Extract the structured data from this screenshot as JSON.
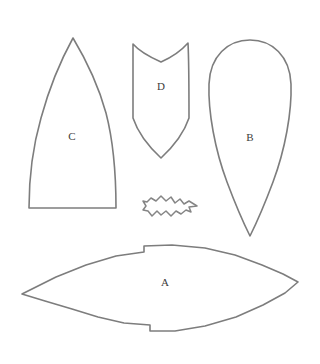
{
  "sheet": {
    "title": "Pattern piece layout",
    "background_color": "#ffffff",
    "outline_color": "#7d7d7d",
    "label_color": "#3c3c3c",
    "width": 320,
    "height": 364
  },
  "pieces": [
    {
      "id": "A",
      "label": "A",
      "name": "lens-body-piece",
      "description": "Large lens/eye shaped piece with notches top and bottom",
      "label_x": 165,
      "label_y": 283,
      "path": "M 22 294 L 56 277 L 86 265 L 116 256 L 144 252 L 144 246 L 172 245 L 205 248 L 235 255 L 262 265 L 283 274 L 298 282 L 285 293 L 263 305 L 236 317 L 205 326 L 175 331 L 150 331 L 150 325 L 124 323 L 98 317 L 72 309 L 45 301 Z"
    },
    {
      "id": "B",
      "label": "B",
      "name": "teardrop-piece",
      "description": "Teardrop shaped piece, rounded top, pointed bottom",
      "label_x": 250,
      "label_y": 138,
      "path": "M 250 40 C 272 40 290 56 291 84 C 292 112 285 150 273 182 C 264 206 255 226 250 236 C 245 226 236 206 227 182 C 215 150 208 112 209 84 C 210 56 228 40 250 40 Z"
    },
    {
      "id": "C",
      "label": "C",
      "name": "gothic-arch-piece",
      "description": "Pointed arch piece with flat bottom edge",
      "label_x": 72,
      "label_y": 137,
      "path": "M 73 38 C 85 58 98 84 106 113 C 113 140 116 170 116 208 L 29 208 C 29 176 33 146 41 118 C 50 85 62 58 73 38 Z"
    },
    {
      "id": "D",
      "label": "D",
      "name": "fishtail-shield-piece",
      "description": "Shield piece with notched twin-peak top and pointed bottom",
      "label_x": 161,
      "label_y": 87,
      "path": "M 133 44 C 140 52 152 58 161 62 C 170 58 181 51 188 43 C 189 62 189 90 189 118 C 185 130 175 145 161 158 C 147 145 137 130 133 118 C 133 90 133 62 133 44 Z"
    },
    {
      "id": "E",
      "label": "",
      "name": "wavy-leaf-piece",
      "description": "Small jagged wavy elongated piece",
      "label_x": 0,
      "label_y": 0,
      "path": "M 197 206 L 189 201 L 184 204 L 180 199 L 175 203 L 171 197 L 166 201 L 161 196 L 156 201 L 151 198 L 147 202 L 143 201 L 146 206 L 143 210 L 148 211 L 152 216 L 157 211 L 161 215 L 166 211 L 171 216 L 176 211 L 181 214 L 186 210 L 191 212 L 189 207 Z"
    }
  ]
}
